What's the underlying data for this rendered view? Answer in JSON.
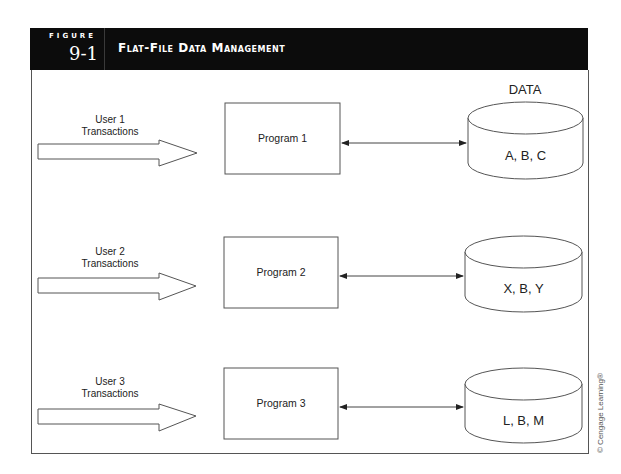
{
  "figure": {
    "label": "FIGURE",
    "number": "9-1",
    "title": "Flat-File Data Management"
  },
  "data_heading": "DATA",
  "rows": [
    {
      "user_line1": "User 1",
      "user_line2": "Transactions",
      "program": "Program 1",
      "data": "A, B, C"
    },
    {
      "user_line1": "User 2",
      "user_line2": "Transactions",
      "program": "Program 2",
      "data": "X, B, Y"
    },
    {
      "user_line1": "User 3",
      "user_line2": "Transactions",
      "program": "Program 3",
      "data": "L, B, M"
    }
  ],
  "copyright": "© Cengage Learning®",
  "colors": {
    "header_bg": "#0c0c0c",
    "header_text": "#ffffff",
    "line": "#555555"
  }
}
